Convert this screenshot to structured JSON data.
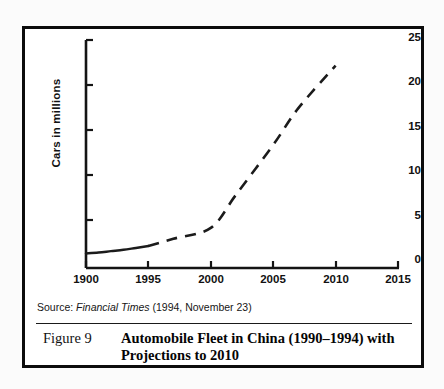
{
  "figure": {
    "number_label": "Figure 9",
    "caption_line1": "Automobile Fleet in China (1990–1994) with",
    "caption_line2": "Projections to 2010",
    "source_prefix": "Source:",
    "source_publication": "Financial Times",
    "source_detail": "(1994, November 23)"
  },
  "colors": {
    "ink": "#0c0c0c",
    "line": "#1b1b1b",
    "paper": "#ffffff"
  },
  "chart_data": {
    "type": "line",
    "title": "",
    "xlabel": "",
    "ylabel": "Cars in millions",
    "xlim": [
      1990,
      2015
    ],
    "ylim": [
      0,
      25
    ],
    "grid": false,
    "legend": "none",
    "xticks": [
      "1900",
      "1995",
      "2000",
      "2005",
      "2010",
      "2015"
    ],
    "xtick_values": [
      1990,
      1995,
      2000,
      2005,
      2010,
      2015
    ],
    "yticks": [
      "0",
      "5",
      "10",
      "15",
      "20",
      "25"
    ],
    "ytick_values": [
      0,
      5,
      10,
      15,
      20,
      25
    ],
    "series": [
      {
        "name": "Actual (1990-1995)",
        "style": "solid",
        "x": [
          1990,
          1991,
          1992,
          1993,
          1994,
          1995
        ],
        "values": [
          1.6,
          1.7,
          1.85,
          2.0,
          2.2,
          2.4
        ]
      },
      {
        "name": "Projection (1995-2010)",
        "style": "dashed",
        "x": [
          1995,
          1997,
          2000,
          2002,
          2005,
          2007,
          2010
        ],
        "values": [
          2.4,
          3.2,
          4.4,
          8.0,
          13.5,
          17.5,
          22.2
        ]
      }
    ]
  }
}
